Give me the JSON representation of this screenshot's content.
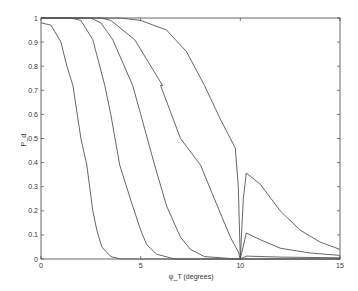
{
  "chart_data": {
    "type": "line",
    "title": "",
    "xlabel": "ψ_T (degrees)",
    "ylabel": "P_d",
    "xlim": [
      0,
      15
    ],
    "ylim": [
      0,
      1
    ],
    "xticks": [
      0,
      5,
      10,
      15
    ],
    "yticks": [
      0,
      0.1,
      0.2,
      0.3,
      0.4,
      0.5,
      0.6,
      0.7,
      0.8,
      0.9,
      1
    ],
    "grid": false,
    "legend": null,
    "line_color": "#555555",
    "series": [
      {
        "name": "curve-1",
        "points": [
          [
            0,
            0.98
          ],
          [
            0.5,
            0.97
          ],
          [
            1.0,
            0.9
          ],
          [
            1.3,
            0.8
          ],
          [
            1.6,
            0.72
          ],
          [
            2.0,
            0.5
          ],
          [
            2.3,
            0.39
          ],
          [
            2.6,
            0.2
          ],
          [
            2.8,
            0.12
          ],
          [
            3.05,
            0.05
          ],
          [
            3.5,
            0.01
          ],
          [
            4.0,
            0.0
          ],
          [
            15,
            0.0
          ]
        ]
      },
      {
        "name": "curve-2",
        "points": [
          [
            0,
            1.0
          ],
          [
            1.5,
            1.0
          ],
          [
            2.0,
            0.99
          ],
          [
            2.6,
            0.91
          ],
          [
            3.2,
            0.72
          ],
          [
            3.5,
            0.6
          ],
          [
            3.95,
            0.39
          ],
          [
            4.5,
            0.245
          ],
          [
            5.0,
            0.12
          ],
          [
            5.3,
            0.06
          ],
          [
            5.8,
            0.02
          ],
          [
            6.7,
            0.0
          ],
          [
            15,
            0.0
          ]
        ]
      },
      {
        "name": "curve-3",
        "points": [
          [
            0,
            1.0
          ],
          [
            2.5,
            1.0
          ],
          [
            3.0,
            0.98
          ],
          [
            3.6,
            0.91
          ],
          [
            4.6,
            0.72
          ],
          [
            5.0,
            0.6
          ],
          [
            5.7,
            0.39
          ],
          [
            6.3,
            0.22
          ],
          [
            7.0,
            0.09
          ],
          [
            7.5,
            0.04
          ],
          [
            8.2,
            0.01
          ],
          [
            9.5,
            0.002
          ],
          [
            10,
            0.0
          ],
          [
            10.3,
            0.012
          ],
          [
            12,
            0.008
          ],
          [
            15,
            0.005
          ]
        ]
      },
      {
        "name": "curve-4",
        "points": [
          [
            0,
            1.0
          ],
          [
            3.0,
            1.0
          ],
          [
            3.5,
            0.99
          ],
          [
            4.7,
            0.91
          ],
          [
            6.1,
            0.72
          ],
          [
            6.0,
            0.72
          ],
          [
            7.0,
            0.5
          ],
          [
            8.0,
            0.39
          ],
          [
            8.7,
            0.25
          ],
          [
            9.5,
            0.09
          ],
          [
            9.9,
            0.03
          ],
          [
            10.0,
            0.0
          ],
          [
            10.3,
            0.108
          ],
          [
            11,
            0.08
          ],
          [
            12,
            0.045
          ],
          [
            13.5,
            0.025
          ],
          [
            15,
            0.015
          ]
        ]
      },
      {
        "name": "curve-5",
        "points": [
          [
            0,
            1.0
          ],
          [
            4.0,
            1.0
          ],
          [
            5.0,
            0.99
          ],
          [
            6.3,
            0.95
          ],
          [
            7.3,
            0.86
          ],
          [
            8.2,
            0.72
          ],
          [
            9.0,
            0.58
          ],
          [
            9.5,
            0.5
          ],
          [
            9.75,
            0.46
          ],
          [
            9.9,
            0.3
          ],
          [
            10.0,
            0.0
          ],
          [
            10.15,
            0.25
          ],
          [
            10.3,
            0.357
          ],
          [
            11,
            0.31
          ],
          [
            12,
            0.2
          ],
          [
            13,
            0.12
          ],
          [
            14,
            0.07
          ],
          [
            15,
            0.04
          ]
        ]
      }
    ]
  }
}
